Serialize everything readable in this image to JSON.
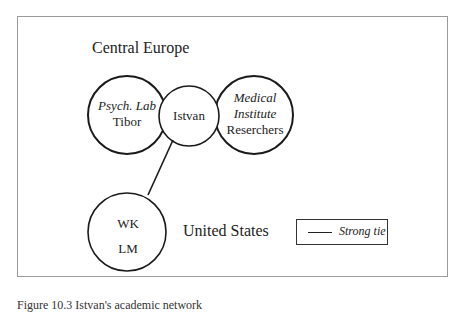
{
  "diagram": {
    "regions": {
      "central_europe": "Central Europe",
      "united_states": "United States"
    },
    "nodes": [
      {
        "id": "psych-lab",
        "group_label": "Psych. Lab",
        "member_label": "Tibor"
      },
      {
        "id": "istvan",
        "label": "Istvan"
      },
      {
        "id": "medical-institute",
        "group_label_line1": "Medical",
        "group_label_line2": "Institute",
        "member_label": "Reserchers"
      },
      {
        "id": "us-contacts",
        "label_line1": "WK",
        "label_line2": "LM"
      }
    ],
    "edges": [
      {
        "from": "istvan",
        "to": "us-contacts",
        "type": "Strong tie"
      }
    ],
    "legend": {
      "strong_tie_label": "Strong tie"
    },
    "caption": "Figure 10.3 Istvan's academic network"
  }
}
